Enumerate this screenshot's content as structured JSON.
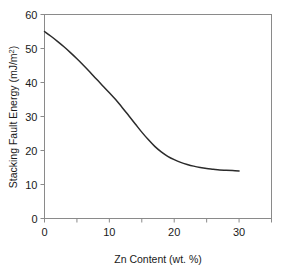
{
  "chart_data": {
    "type": "line",
    "title": "",
    "xlabel": "Zn Content (wt. %)",
    "ylabel": "Stacking Fault Energy (mJ/m²)",
    "ylabel_base": "Stacking Fault Energy (mJ/m",
    "ylabel_sup": "2",
    "ylabel_tail": ")",
    "xlim": [
      0,
      35
    ],
    "ylim": [
      0,
      60
    ],
    "xticks": [
      0,
      5,
      10,
      15,
      20,
      25,
      30,
      35
    ],
    "xtick_labels": [
      "0",
      "",
      "10",
      "",
      "20",
      "",
      "30",
      ""
    ],
    "xtick_major_labels": [
      "0",
      "10",
      "20",
      "30"
    ],
    "yticks": [
      0,
      10,
      20,
      30,
      40,
      50,
      60
    ],
    "ytick_labels": [
      "0",
      "10",
      "20",
      "30",
      "40",
      "50",
      "60"
    ],
    "grid": false,
    "legend": false,
    "legend_position": "none",
    "series": [
      {
        "name": "Stacking fault energy vs Zn content",
        "color": "#2b2b2b",
        "line_width": 1.5,
        "x": [
          0,
          1,
          2,
          3,
          4,
          5,
          6,
          7,
          8,
          9,
          10,
          11,
          12,
          13,
          14,
          15,
          16,
          17,
          18,
          19,
          20,
          21,
          22,
          23,
          24,
          25,
          26,
          27,
          28,
          29,
          30
        ],
        "y": [
          55.0,
          53.6,
          52.1,
          50.5,
          48.8,
          47.0,
          45.1,
          43.1,
          41.0,
          39.0,
          37.0,
          34.9,
          32.6,
          30.2,
          27.8,
          25.4,
          23.2,
          21.2,
          19.6,
          18.3,
          17.3,
          16.5,
          15.9,
          15.4,
          15.0,
          14.7,
          14.5,
          14.3,
          14.2,
          14.1,
          14.0
        ]
      }
    ],
    "annotations": [],
    "axis_style": {
      "frame": "box",
      "frame_color": "#888888",
      "tick_direction": "out",
      "background": "#ffffff"
    }
  }
}
